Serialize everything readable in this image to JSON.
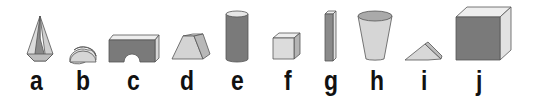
{
  "figure": {
    "colors": {
      "stroke": "#555555",
      "light": "#d8d8d8",
      "mid": "#aaaaaa",
      "dark": "#7a7a7a",
      "top": "#eeeeee",
      "label": "#111111"
    },
    "shapes": [
      {
        "label": "a",
        "name": "hexagonal pyramid"
      },
      {
        "label": "b",
        "name": "half cylinder"
      },
      {
        "label": "c",
        "name": "arch block"
      },
      {
        "label": "d",
        "name": "trapezoidal prism"
      },
      {
        "label": "e",
        "name": "cylinder"
      },
      {
        "label": "f",
        "name": "small cube"
      },
      {
        "label": "g",
        "name": "tall rectangular prism"
      },
      {
        "label": "h",
        "name": "cup"
      },
      {
        "label": "i",
        "name": "triangular prism"
      },
      {
        "label": "j",
        "name": "large cube"
      }
    ]
  }
}
